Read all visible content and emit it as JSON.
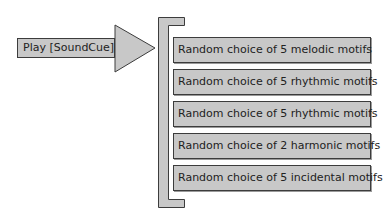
{
  "trigger": {
    "label": "Play [SoundCue]"
  },
  "motifs": [
    {
      "label": "Random choice of 5 melodic motifs"
    },
    {
      "label": "Random choice of 5 rhythmic motifs"
    },
    {
      "label": "Random choice of 5 rhythmic motifs"
    },
    {
      "label": "Random choice of 2 harmonic motifs"
    },
    {
      "label": "Random choice of 5 incidental motifs"
    }
  ],
  "colors": {
    "fill": "#c8c8c8",
    "stroke": "#3c3c3c",
    "background": "#ffffff"
  }
}
